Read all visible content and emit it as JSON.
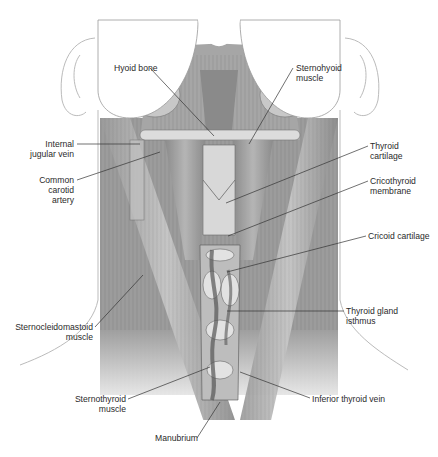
{
  "figure": {
    "labels": {
      "hyoid_bone": [
        "Hyoid bone"
      ],
      "sternohyoid_muscle": [
        "Sternohyoid",
        "muscle"
      ],
      "internal_jugular_vein": [
        "Internal",
        "jugular vein"
      ],
      "common_carotid_artery": [
        "Common",
        "carotid",
        "artery"
      ],
      "thyroid_cartilage": [
        "Thyroid",
        "cartilage"
      ],
      "cricothyroid_membrane": [
        "Cricothyroid",
        "membrane"
      ],
      "cricoid_cartilage": [
        "Cricoid cartilage"
      ],
      "thyroid_gland_isthmus": [
        "Thyroid gland",
        "isthmus"
      ],
      "sternocleidomastoid_muscle": [
        "Sternocleidomastoid",
        "muscle"
      ],
      "sternothyroid_muscle": [
        "Sternothyroid",
        "muscle"
      ],
      "inferior_thyroid_vein": [
        "Inferior thyroid vein"
      ],
      "manubrium": [
        "Manubrium"
      ]
    }
  }
}
